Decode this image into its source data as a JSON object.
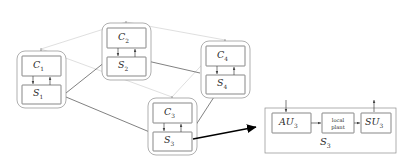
{
  "figure": {
    "type": "block-diagram",
    "colors": {
      "node_stroke": "#555555",
      "node_fill": "#ffffff",
      "cluster_stroke": "#777777",
      "plant_link": "#333333",
      "controller_link": "#bfbfbf",
      "zoom_arrow": "#000000",
      "text": "#2b2b2b"
    }
  },
  "clusters": [
    {
      "id": "cluster-1",
      "controller": {
        "name": "C",
        "index": "1"
      },
      "subsystem": {
        "name": "S",
        "index": "1"
      }
    },
    {
      "id": "cluster-2",
      "controller": {
        "name": "C",
        "index": "2"
      },
      "subsystem": {
        "name": "S",
        "index": "2"
      }
    },
    {
      "id": "cluster-3",
      "controller": {
        "name": "C",
        "index": "3"
      },
      "subsystem": {
        "name": "S",
        "index": "3"
      }
    },
    {
      "id": "cluster-4",
      "controller": {
        "name": "C",
        "index": "4"
      },
      "subsystem": {
        "name": "S",
        "index": "4"
      }
    }
  ],
  "detail": {
    "caption": {
      "name": "S",
      "index": "3"
    },
    "blocks": [
      {
        "id": "au",
        "name": "AU",
        "index": "3"
      },
      {
        "id": "plant",
        "name": "local\nplant",
        "index": ""
      },
      {
        "id": "su",
        "name": "SU",
        "index": "3"
      }
    ]
  },
  "edges": {
    "plant_links": [
      "S1-S2",
      "S1-S3",
      "S2-S4",
      "S3-S4"
    ],
    "controller_links": [
      "C1-C2",
      "C2-C4",
      "C1-C3",
      "C3-C4"
    ],
    "internal": [
      "C1-S1",
      "S1-C1",
      "C2-S2",
      "S2-C2",
      "C3-S3",
      "S3-C3",
      "C4-S4",
      "S4-C4"
    ],
    "zoom_pointer": "S3-detail"
  }
}
